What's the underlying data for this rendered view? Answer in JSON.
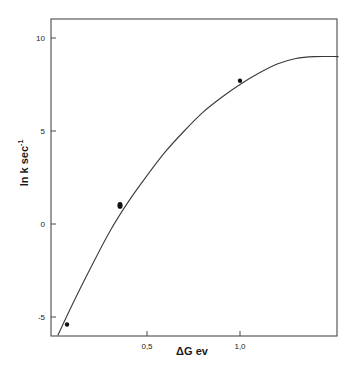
{
  "chart_data": {
    "type": "line",
    "title": "",
    "xlabel": "ΔG  ev",
    "ylabel": "ln k  sec",
    "ylabel_superscript": "-1",
    "x_ticks": [
      {
        "value": 0.5,
        "label": "0,5"
      },
      {
        "value": 1.0,
        "label": "1,0"
      }
    ],
    "y_ticks": [
      {
        "value": 10,
        "label": "10"
      },
      {
        "value": 5,
        "label": "5"
      },
      {
        "value": 0,
        "label": "0"
      },
      {
        "value": -5,
        "label": "-5"
      }
    ],
    "xlim": [
      -0.016,
      1.53
    ],
    "ylim": [
      -6.0,
      11.0
    ],
    "grid": false,
    "legend": null,
    "series": [
      {
        "name": "fitted curve",
        "kind": "line",
        "x": [
          0.02,
          0.1,
          0.2,
          0.3,
          0.4,
          0.5,
          0.6,
          0.7,
          0.8,
          0.9,
          1.0,
          1.1,
          1.2,
          1.3,
          1.4,
          1.53
        ],
        "y": [
          -6.0,
          -4.3,
          -2.3,
          -0.4,
          1.2,
          2.6,
          3.9,
          5.0,
          6.0,
          6.8,
          7.5,
          8.1,
          8.6,
          8.9,
          9.0,
          9.0
        ]
      },
      {
        "name": "experimental points",
        "kind": "scatter",
        "x": [
          0.07,
          0.355,
          1.0
        ],
        "y": [
          -5.4,
          1.0,
          7.7
        ]
      }
    ]
  }
}
